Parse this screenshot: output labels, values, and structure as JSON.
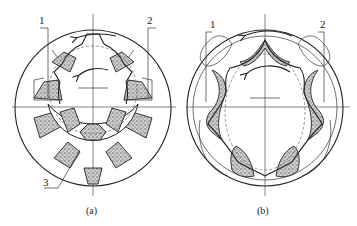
{
  "figure": {
    "colors": {
      "line": "#222222",
      "stipple": "#8a8a8a",
      "background": "#ffffff"
    },
    "panels": [
      {
        "id": "a",
        "caption": "(a)",
        "type": "internal-gear-pump-with-crescent",
        "labels": [
          {
            "text": "1"
          },
          {
            "text": "2"
          },
          {
            "text": "3"
          }
        ]
      },
      {
        "id": "b",
        "caption": "(b)",
        "type": "gerotor-pump",
        "labels": [
          {
            "text": "1"
          },
          {
            "text": "2"
          }
        ]
      }
    ]
  }
}
